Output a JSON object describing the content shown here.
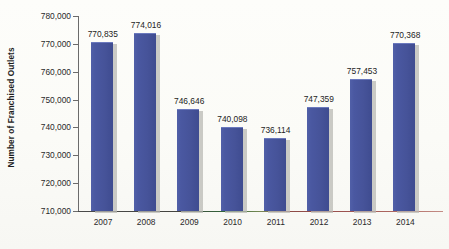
{
  "chart_data": {
    "type": "bar",
    "title": "",
    "xlabel": "",
    "ylabel": "Number of Franchised Outlets",
    "categories": [
      "2007",
      "2008",
      "2009",
      "2010",
      "2011",
      "2012",
      "2013",
      "2014"
    ],
    "values": [
      770835,
      774016,
      746646,
      740098,
      736114,
      747359,
      757453,
      770368
    ],
    "value_labels": [
      "770,835",
      "774,016",
      "746,646",
      "740,098",
      "736,114",
      "747,359",
      "757,453",
      "770,368"
    ],
    "ylim": [
      710000,
      780000
    ],
    "ytick_values": [
      710000,
      720000,
      730000,
      740000,
      750000,
      760000,
      770000,
      780000
    ],
    "ytick_labels": [
      "710,000",
      "720,000",
      "730,000",
      "740,000",
      "750,000",
      "760,000",
      "770,000",
      "780,000"
    ],
    "grid": false,
    "legend": false,
    "legend_position": "none",
    "series": [
      {
        "name": "Number of Franchised Outlets",
        "values": [
          770835,
          774016,
          746646,
          740098,
          736114,
          747359,
          757453,
          770368
        ]
      }
    ],
    "colors": {
      "bar_fill": "#4a58a1",
      "bar_edge": "#6b79bd",
      "bar_shadow": "#b9b9b4",
      "axis": "#6b6b6b",
      "text": "#242424",
      "background": "#fdfdfb"
    }
  }
}
